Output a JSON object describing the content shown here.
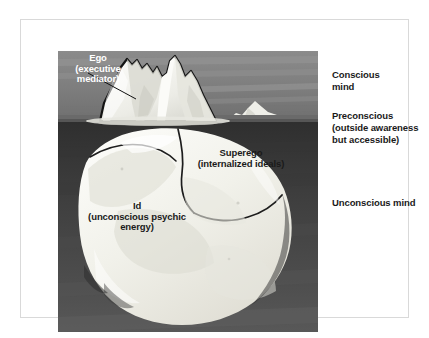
{
  "figure": {
    "kind": "freud-iceberg-diagram",
    "frame_color": "#d9d9d9",
    "background_color": "#ffffff"
  },
  "painting": {
    "sky_color": "#7e7e7e",
    "sky_highlight_color": "#9a9a9a",
    "water_surface_color": "#5a5a5a",
    "deep_water_color": "#3b3b3b",
    "ice_light_color": "#f4f4f0",
    "ice_shadow_color": "#cfcfc8",
    "ice_outline_color": "#141414",
    "distant_iceberg_color": "#eeeeea"
  },
  "overlay_labels": {
    "ego": {
      "line1": "Ego",
      "line2": "(executive",
      "line3": "mediator)",
      "color": "#ffffff",
      "leader_line": true
    },
    "superego": {
      "line1": "Superego",
      "line2": "(internalized ideals)",
      "color": "#1a1a1a"
    },
    "id": {
      "line1": "Id",
      "line2": "(unconscious psychic",
      "line3": "energy)",
      "color": "#1a1a1a"
    }
  },
  "legend": {
    "conscious": {
      "line1": "Conscious",
      "line2": "mind"
    },
    "preconscious": {
      "line1": "Preconscious",
      "line2": "(outside awareness",
      "line3": "but accessible)"
    },
    "unconscious": {
      "line1": "Unconscious mind"
    }
  }
}
